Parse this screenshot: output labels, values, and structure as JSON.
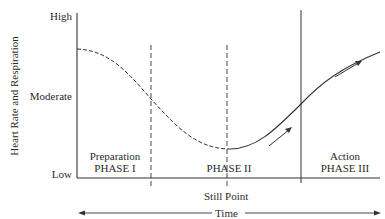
{
  "diagram": {
    "y_axis": {
      "label": "Heart Rate and Respiration",
      "ticks": [
        "High",
        "Moderate",
        "Low"
      ]
    },
    "x_axis": {
      "label": "Time",
      "marker_label": "Still Point"
    },
    "phases": [
      {
        "name": "Preparation",
        "number": "PHASE I"
      },
      {
        "name": "",
        "number": "PHASE II"
      },
      {
        "name": "Action",
        "number": "PHASE III"
      }
    ],
    "curve": {
      "description": "Falls from near-high through moderate to low minimum at the Still Point, then rises back toward high",
      "segments": [
        {
          "style": "dashed",
          "from": "start",
          "to": "still point"
        },
        {
          "style": "solid",
          "from": "still point",
          "to": "end"
        }
      ],
      "direction_arrows": 2
    },
    "colors": {
      "line": "#333333",
      "background": "#ffffff"
    }
  }
}
